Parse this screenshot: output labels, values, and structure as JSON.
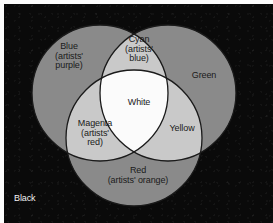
{
  "figure": {
    "background_label": "Black",
    "colors": {
      "panel_background": "#0a0a0a",
      "primary_circle_fill": "#8a8a8a",
      "secondary_overlap_fill": "#c9c9c9",
      "center_fill": "#fbfbfb",
      "outline": "#1a1a1a",
      "dark_text": "#1a1a1a",
      "light_text": "#f2f2f2"
    }
  },
  "regions": {
    "blue": {
      "name": "Blue",
      "alias": "(artists'\npurple)",
      "label": "Blue\n(artists'\npurple)",
      "kind": "primary",
      "fill": "#8a8a8a"
    },
    "green": {
      "name": "Green",
      "alias": "",
      "label": "Green",
      "kind": "primary",
      "fill": "#8a8a8a"
    },
    "red": {
      "name": "Red",
      "alias": "(artists' orange)",
      "label": "Red\n(artists' orange)",
      "kind": "primary",
      "fill": "#8a8a8a"
    },
    "cyan": {
      "name": "Cyan",
      "alias": "(artists'\nblue)",
      "label": "Cyan\n(artists'\nblue)",
      "kind": "overlap",
      "mix_of": "Blue + Green",
      "fill": "#c9c9c9"
    },
    "magenta": {
      "name": "Magenta",
      "alias": "(artists'\nred)",
      "label": "Magenta\n(artists'\nred)",
      "kind": "overlap",
      "mix_of": "Blue + Red",
      "fill": "#c9c9c9"
    },
    "yellow": {
      "name": "Yellow",
      "alias": "",
      "label": "Yellow",
      "kind": "overlap",
      "mix_of": "Green + Red",
      "fill": "#c9c9c9"
    },
    "white": {
      "name": "White",
      "alias": "",
      "label": "White",
      "kind": "center",
      "mix_of": "Blue + Green + Red",
      "fill": "#fbfbfb"
    },
    "black": {
      "name": "Black",
      "alias": "",
      "label": "Black",
      "kind": "background",
      "fill": "#0a0a0a"
    }
  }
}
